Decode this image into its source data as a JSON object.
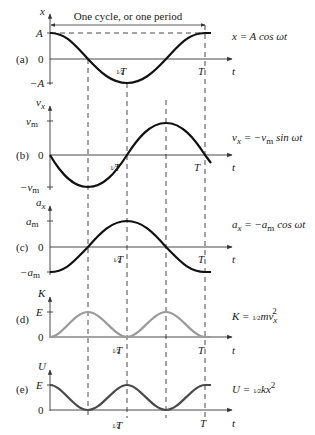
{
  "header": {
    "cycle_label": "One cycle, or one period"
  },
  "axis": {
    "t_label": "t",
    "half_period_label": "T",
    "half_frac": "1⁄2",
    "period_label": "T"
  },
  "panels": [
    {
      "id": "a",
      "tag": "(a)",
      "y_axis": "x",
      "top_tick": "A",
      "zero": "0",
      "bottom_tick": "−A",
      "equation": "x = A cos ωt",
      "curve": "cos"
    },
    {
      "id": "b",
      "tag": "(b)",
      "y_axis": "v",
      "y_axis_sub": "x",
      "top_tick": "v",
      "top_tick_sub": "m",
      "zero": "0",
      "bottom_tick": "−v",
      "bottom_tick_sub": "m",
      "equation_lhs": "v",
      "equation_lhs_sub": "x",
      "equation_mid": " = −v",
      "equation_mid_sub": "m",
      "equation_rhs": " sin ωt",
      "curve": "-sin"
    },
    {
      "id": "c",
      "tag": "(c)",
      "y_axis": "a",
      "y_axis_sub": "x",
      "top_tick": "a",
      "top_tick_sub": "m",
      "zero": "0",
      "bottom_tick": "−a",
      "bottom_tick_sub": "m",
      "equation_lhs": "a",
      "equation_lhs_sub": "x",
      "equation_mid": " = −a",
      "equation_mid_sub": "m",
      "equation_rhs": " cos ωt",
      "curve": "-cos"
    },
    {
      "id": "d",
      "tag": "(d)",
      "y_axis": "K",
      "top_tick": "E",
      "zero": "0",
      "equation_lhs": "K = ",
      "equation_frac": "1⁄2",
      "equation_rhs": "mv",
      "equation_sub": "x",
      "equation_sup": "2",
      "curve": "sin^2",
      "color": "#9a9a9a"
    },
    {
      "id": "e",
      "tag": "(e)",
      "y_axis": "U",
      "top_tick": "E",
      "zero": "0",
      "equation_lhs": "U = ",
      "equation_frac": "1⁄2",
      "equation_rhs": "kx",
      "equation_sup": "2",
      "curve": "cos^2",
      "color": "#4a4a4a"
    }
  ],
  "colors": {
    "curve_dark": "#111111",
    "curve_k": "#9a9a9a",
    "curve_u": "#4a4a4a",
    "axis": "#333333",
    "dash": "#333333"
  }
}
